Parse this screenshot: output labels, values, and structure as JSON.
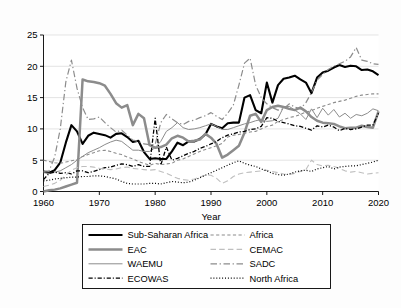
{
  "chart_data": {
    "type": "line",
    "title": "",
    "xlabel": "Year",
    "ylabel": "",
    "xlim": [
      1960,
      2020
    ],
    "ylim": [
      0,
      25
    ],
    "grid": true,
    "legend_position": "below-axes",
    "x_ticks": [
      "1960",
      "1970",
      "1980",
      "1990",
      "2000",
      "2010",
      "2020"
    ],
    "y_ticks": [
      "0",
      "5",
      "10",
      "15",
      "20",
      "25"
    ],
    "x": [
      1960,
      1961,
      1962,
      1963,
      1964,
      1965,
      1966,
      1967,
      1968,
      1969,
      1970,
      1971,
      1972,
      1973,
      1974,
      1975,
      1976,
      1977,
      1978,
      1979,
      1980,
      1981,
      1982,
      1983,
      1984,
      1985,
      1986,
      1987,
      1988,
      1989,
      1990,
      1991,
      1992,
      1993,
      1994,
      1995,
      1996,
      1997,
      1998,
      1999,
      2000,
      2001,
      2002,
      2003,
      2004,
      2005,
      2006,
      2007,
      2008,
      2009,
      2010,
      2011,
      2012,
      2013,
      2014,
      2015,
      2016,
      2017,
      2018,
      2019,
      2020
    ],
    "series": [
      {
        "name": "Sub-Saharan Africa",
        "color": "#000000",
        "width": 2.1,
        "dash": "none",
        "values": [
          3.2,
          3.0,
          3.4,
          4.6,
          7.8,
          10.6,
          9.6,
          7.6,
          8.9,
          9.4,
          9.2,
          9.0,
          8.6,
          9.2,
          9.3,
          8.7,
          7.9,
          8.1,
          6.3,
          5.2,
          5.3,
          5.2,
          5.2,
          6.4,
          7.8,
          7.4,
          8.0,
          8.0,
          8.4,
          9.1,
          10.8,
          10.4,
          10.1,
          10.9,
          11.0,
          11.0,
          15.0,
          15.4,
          13.0,
          12.5,
          17.4,
          14.2,
          17.0,
          18.0,
          18.2,
          18.5,
          17.9,
          17.4,
          15.7,
          18.2,
          19.0,
          19.3,
          19.8,
          20.2,
          19.9,
          20.1,
          20.0,
          19.4,
          19.5,
          19.2,
          18.6
        ]
      },
      {
        "name": "EAC",
        "color": "#8c8c8c",
        "width": 2.5,
        "dash": "none",
        "values": [
          0.0,
          0.2,
          0.3,
          0.5,
          0.8,
          1.1,
          1.4,
          17.9,
          17.6,
          17.5,
          17.3,
          16.9,
          15.6,
          14.1,
          13.4,
          13.8,
          10.6,
          12.4,
          11.7,
          7.4,
          7.0,
          7.1,
          7.5,
          8.5,
          8.9,
          8.6,
          8.0,
          8.1,
          8.3,
          9.2,
          8.6,
          7.6,
          5.4,
          5.9,
          6.6,
          7.3,
          9.4,
          12.1,
          12.4,
          11.1,
          13.0,
          13.5,
          13.7,
          13.5,
          13.2,
          13.0,
          13.4,
          12.8,
          11.9,
          11.3,
          11.0,
          10.9,
          10.8,
          10.4,
          10.1,
          10.2,
          10.2,
          10.5,
          10.3,
          10.2,
          12.8
        ]
      },
      {
        "name": "WAEMU",
        "color": "#8c8c8c",
        "width": 1.0,
        "dash": "none",
        "values": [
          3.0,
          2.9,
          3.1,
          3.3,
          3.8,
          4.3,
          5.0,
          5.6,
          6.2,
          6.6,
          7.0,
          7.5,
          7.9,
          8.2,
          8.0,
          7.3,
          6.6,
          6.6,
          6.4,
          6.4,
          7.0,
          8.0,
          9.6,
          10.2,
          11.0,
          10.2,
          9.9,
          10.0,
          10.2,
          10.5,
          10.8,
          10.4,
          9.9,
          9.9,
          10.2,
          10.5,
          10.8,
          11.0,
          11.3,
          11.5,
          11.2,
          11.3,
          11.7,
          13.5,
          13.6,
          13.0,
          12.4,
          11.5,
          13.2,
          11.8,
          13.3,
          12.2,
          13.1,
          11.9,
          12.5,
          11.7,
          12.3,
          12.1,
          12.5,
          13.2,
          12.9
        ]
      },
      {
        "name": "ECOWAS",
        "color": "#000000",
        "width": 1.3,
        "dash": "dashdot",
        "values": [
          1.9,
          2.9,
          3.1,
          2.9,
          3.0,
          2.8,
          3.3,
          3.3,
          3.0,
          3.2,
          3.5,
          3.8,
          3.9,
          4.2,
          4.4,
          4.3,
          4.0,
          4.3,
          4.0,
          4.0,
          11.7,
          4.2,
          7.1,
          5.0,
          5.3,
          5.7,
          6.1,
          6.4,
          6.9,
          7.2,
          7.6,
          8.0,
          8.6,
          9.0,
          9.2,
          9.5,
          9.6,
          9.9,
          10.0,
          10.4,
          11.8,
          11.7,
          11.2,
          11.0,
          10.8,
          10.5,
          10.4,
          10.1,
          9.8,
          10.5,
          10.3,
          10.6,
          10.3,
          9.7,
          10.1,
          9.9,
          10.0,
          10.3,
          10.6,
          10.6,
          12.5
        ]
      },
      {
        "name": "Africa",
        "color": "#8c8c8c",
        "width": 1.1,
        "dash": "shortdash",
        "values": [
          5.0,
          4.8,
          4.6,
          4.5,
          4.7,
          4.9,
          5.1,
          5.6,
          5.9,
          6.2,
          6.5,
          6.6,
          6.4,
          6.1,
          5.9,
          5.5,
          5.2,
          4.8,
          4.5,
          4.2,
          4.5,
          4.3,
          4.4,
          4.5,
          5.0,
          5.2,
          5.6,
          6.0,
          6.4,
          6.7,
          7.0,
          7.3,
          7.7,
          8.7,
          9.0,
          9.1,
          9.3,
          9.5,
          9.6,
          10.0,
          10.4,
          10.6,
          11.2,
          11.5,
          11.8,
          12.0,
          12.3,
          12.7,
          12.9,
          13.3,
          13.6,
          13.9,
          14.2,
          14.4,
          14.6,
          14.9,
          15.2,
          15.4,
          15.5,
          15.6,
          15.6
        ]
      },
      {
        "name": "CEMAC",
        "color": "#bfbfbf",
        "width": 1.1,
        "dash": "longdash",
        "values": [
          0.8,
          1.0,
          1.3,
          1.8,
          2.6,
          3.4,
          3.8,
          4.0,
          4.0,
          3.9,
          3.7,
          3.6,
          3.5,
          3.6,
          3.8,
          3.9,
          3.7,
          3.6,
          3.5,
          3.4,
          3.5,
          3.2,
          2.9,
          2.5,
          2.1,
          1.9,
          1.8,
          2.0,
          2.3,
          2.6,
          2.6,
          2.1,
          1.3,
          1.7,
          2.4,
          2.8,
          3.0,
          3.1,
          3.2,
          3.3,
          3.4,
          3.2,
          3.0,
          2.8,
          2.7,
          2.9,
          3.2,
          3.5,
          5.0,
          4.3,
          4.1,
          4.2,
          4.0,
          3.7,
          3.3,
          3.1,
          3.2,
          3.0,
          2.8,
          2.9,
          3.0
        ]
      },
      {
        "name": "SADC",
        "color": "#8c8c8c",
        "width": 1.2,
        "dash": "dashdotlong",
        "values": [
          3.2,
          3.3,
          5.5,
          10.0,
          17.5,
          21.0,
          16.5,
          13.4,
          11.5,
          11.6,
          11.9,
          11.0,
          10.2,
          9.5,
          9.8,
          9.0,
          8.2,
          8.0,
          7.6,
          7.5,
          7.5,
          11.0,
          12.3,
          11.6,
          11.0,
          10.7,
          11.2,
          11.4,
          11.8,
          12.1,
          12.6,
          12.0,
          11.5,
          12.5,
          13.8,
          17.0,
          20.5,
          21.3,
          17.0,
          15.0,
          14.0,
          13.4,
          13.0,
          13.2,
          14.0,
          13.5,
          13.2,
          14.2,
          15.8,
          17.8,
          18.7,
          19.5,
          20.0,
          20.4,
          20.8,
          21.5,
          23.0,
          21.0,
          20.8,
          20.4,
          20.3
        ]
      },
      {
        "name": "North Africa",
        "color": "#000000",
        "width": 1.2,
        "dash": "dotted",
        "values": [
          1.7,
          1.8,
          2.0,
          2.1,
          2.2,
          2.3,
          2.3,
          2.4,
          2.4,
          2.5,
          2.5,
          2.4,
          2.2,
          2.0,
          1.6,
          1.3,
          1.2,
          1.2,
          1.2,
          1.3,
          1.3,
          1.2,
          1.4,
          1.6,
          1.5,
          1.4,
          1.5,
          1.8,
          2.2,
          2.6,
          3.0,
          3.4,
          3.8,
          4.2,
          4.6,
          4.9,
          4.5,
          4.2,
          4.0,
          3.6,
          3.3,
          2.9,
          2.7,
          2.6,
          2.8,
          3.1,
          3.3,
          3.4,
          3.2,
          3.6,
          3.8,
          4.0,
          3.6,
          3.9,
          4.0,
          4.1,
          4.1,
          4.3,
          4.5,
          4.7,
          5.0
        ]
      }
    ]
  },
  "legend": {
    "entries": [
      {
        "label": "Sub-Saharan Africa",
        "column": "left",
        "row": 0
      },
      {
        "label": "EAC",
        "column": "left",
        "row": 1
      },
      {
        "label": "WAEMU",
        "column": "left",
        "row": 2
      },
      {
        "label": "ECOWAS",
        "column": "left",
        "row": 3
      },
      {
        "label": "Africa",
        "column": "right",
        "row": 0
      },
      {
        "label": "CEMAC",
        "column": "right",
        "row": 1
      },
      {
        "label": "SADC",
        "column": "right",
        "row": 2
      },
      {
        "label": "North Africa",
        "column": "right",
        "row": 3
      }
    ]
  },
  "axes": {
    "x_title": "Year",
    "x_tick_labels": [
      "1960",
      "1970",
      "1980",
      "1990",
      "2000",
      "2010",
      "2020"
    ],
    "y_tick_labels": [
      "0",
      "5",
      "10",
      "15",
      "20",
      "25"
    ]
  },
  "colors": {
    "black": "#000000",
    "gray": "#8c8c8c",
    "light_gray": "#bfbfbf",
    "grid": "#d8d8d8",
    "plot_background": "#ffffff",
    "page_background": "#fdfdfd"
  }
}
